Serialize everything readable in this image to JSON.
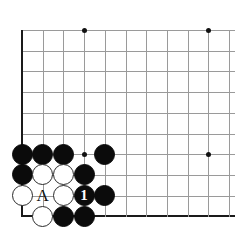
{
  "figure": {
    "kind": "go-board-diagram",
    "board_size": 19,
    "view": "bottom-left corner",
    "background_color": "#ffffff",
    "line_color": "#9a9a9a",
    "edge_color": "#1a1a1a",
    "black_color": "#0b0b0b",
    "white_color": "#ffffff"
  },
  "geometry": {
    "origin_x": 22,
    "origin_y": 30,
    "spacing": 20.7,
    "cols_visible": 11,
    "rows_visible": 10,
    "stone_diameter": 21,
    "bottom_edge_y": 216
  },
  "star_points": [
    {
      "col": 4,
      "row": 1
    },
    {
      "col": 10,
      "row": 1
    },
    {
      "col": 4,
      "row": 7
    },
    {
      "col": 10,
      "row": 7
    }
  ],
  "stones": [
    {
      "id": "b-c1r7",
      "color": "black",
      "col": 1,
      "row": 7,
      "label": ""
    },
    {
      "id": "b-c2r7",
      "color": "black",
      "col": 2,
      "row": 7,
      "label": ""
    },
    {
      "id": "b-c3r7",
      "color": "black",
      "col": 3,
      "row": 7,
      "label": ""
    },
    {
      "id": "b-c5r7",
      "color": "black",
      "col": 5,
      "row": 7,
      "label": ""
    },
    {
      "id": "b-c1r8",
      "color": "black",
      "col": 1,
      "row": 8,
      "label": ""
    },
    {
      "id": "w-c2r8",
      "color": "white",
      "col": 2,
      "row": 8,
      "label": ""
    },
    {
      "id": "w-c3r8",
      "color": "white",
      "col": 3,
      "row": 8,
      "label": ""
    },
    {
      "id": "b-c4r8",
      "color": "black",
      "col": 4,
      "row": 8,
      "label": ""
    },
    {
      "id": "w-c1r9",
      "color": "white",
      "col": 1,
      "row": 9,
      "label": ""
    },
    {
      "id": "w-c3r9",
      "color": "white",
      "col": 3,
      "row": 9,
      "label": ""
    },
    {
      "id": "b-c4r9",
      "color": "black",
      "col": 4,
      "row": 9,
      "label": "1"
    },
    {
      "id": "b-c5r9",
      "color": "black",
      "col": 5,
      "row": 9,
      "label": ""
    },
    {
      "id": "w-c2r10",
      "color": "white",
      "col": 2,
      "row": 10,
      "label": ""
    },
    {
      "id": "b-c3r10",
      "color": "black",
      "col": 3,
      "row": 10,
      "label": ""
    },
    {
      "id": "b-c4r10",
      "color": "black",
      "col": 4,
      "row": 10,
      "label": ""
    }
  ],
  "point_labels": [
    {
      "id": "label-a",
      "text": "A",
      "col": 2,
      "row": 9
    }
  ],
  "move_numbers": {
    "move_1": "1"
  }
}
